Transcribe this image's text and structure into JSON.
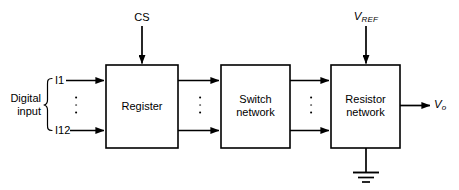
{
  "figure": {
    "type": "block-diagram",
    "background_color": "#ffffff",
    "line_color": "#000000"
  },
  "blocks": [
    {
      "id": "register",
      "label": "Register",
      "x": 106,
      "y": 65,
      "w": 72,
      "h": 83
    },
    {
      "id": "switch_network",
      "label": "Switch\nnetwork",
      "line1": "Switch",
      "line2": "network",
      "x": 221,
      "y": 65,
      "w": 69,
      "h": 83
    },
    {
      "id": "resistor_network",
      "label": "Resistor\nnetwork",
      "line1": "Resistor",
      "line2": "network",
      "x": 331,
      "y": 65,
      "w": 69,
      "h": 83
    }
  ],
  "signals": {
    "cs": "CS",
    "vref_base": "V",
    "vref_sub": "REF",
    "vout_base": "V",
    "vout_sub": "o",
    "input_top": "I1",
    "input_bottom": "I12",
    "group_line1": "Digital",
    "group_line2": "input"
  },
  "ellipses": [
    {
      "id": "input-bus-dots",
      "x": 76,
      "y": 105
    },
    {
      "id": "register-switch-dots",
      "x": 200,
      "y": 105
    },
    {
      "id": "switch-resistor-dots",
      "x": 311,
      "y": 105
    }
  ],
  "ground": {
    "label": "earth-ground",
    "stem_x": 366,
    "stem_top": 148,
    "stem_bottom": 172
  }
}
